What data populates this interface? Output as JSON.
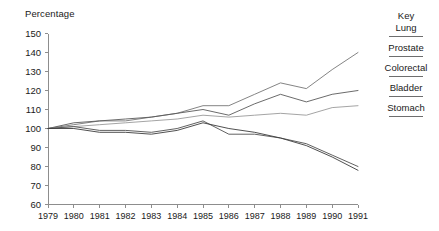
{
  "chart": {
    "ylabel": "Percentage",
    "legend_title": "Key"
  },
  "legend": {
    "position": "right",
    "entries": [
      {
        "label": "Lung",
        "color": "#6e6e6e"
      },
      {
        "label": "Prostate",
        "color": "#6e6e6e"
      },
      {
        "label": "Colorectal",
        "color": "#6e6e6e"
      },
      {
        "label": "Bladder",
        "color": "#6e6e6e"
      },
      {
        "label": "Stomach",
        "color": "#6e6e6e"
      }
    ]
  },
  "chart_data": {
    "type": "line",
    "title": "",
    "xlabel": "",
    "ylabel": "Percentage",
    "ylim": [
      60,
      150
    ],
    "yticks": [
      60,
      70,
      80,
      90,
      100,
      110,
      120,
      130,
      140,
      150
    ],
    "grid": false,
    "legend_position": "right",
    "x": [
      1979,
      1980,
      1981,
      1982,
      1983,
      1984,
      1985,
      1986,
      1987,
      1988,
      1989,
      1990,
      1991
    ],
    "xtick_labels": [
      "1979",
      "1980",
      "1981",
      "1982",
      "1983",
      "1984",
      "1985",
      "1986",
      "1987",
      "1988",
      "1989",
      "1990",
      "1991"
    ],
    "series": [
      {
        "name": "Prostate",
        "color": "#767676",
        "values": [
          100,
          102,
          104,
          104,
          106,
          108,
          112,
          112,
          118,
          124,
          121,
          131,
          140
        ]
      },
      {
        "name": "Lung",
        "color": "#5a5a5a",
        "values": [
          100,
          103,
          104,
          105,
          106,
          108,
          110,
          107,
          113,
          118,
          114,
          118,
          120
        ]
      },
      {
        "name": "Colorectal",
        "color": "#9a9a9a",
        "values": [
          100,
          101,
          102,
          103,
          104,
          105,
          107,
          106,
          107,
          108,
          107,
          111,
          112
        ]
      },
      {
        "name": "Bladder",
        "color": "#4f4f4f",
        "values": [
          100,
          101,
          99,
          99,
          98,
          100,
          104,
          97,
          97,
          95,
          92,
          86,
          80
        ]
      },
      {
        "name": "Stomach",
        "color": "#3c3c3c",
        "values": [
          100,
          100,
          98,
          98,
          97,
          99,
          103,
          100,
          98,
          95,
          91,
          85,
          78
        ]
      }
    ]
  },
  "axes": {
    "x_axis_min": 1979,
    "x_axis_max": 1991,
    "y_axis_min": 60,
    "y_axis_max": 150
  }
}
